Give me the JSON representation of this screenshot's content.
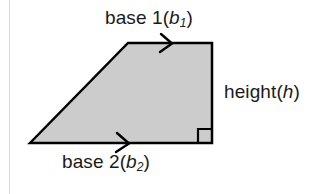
{
  "figure": {
    "shape": {
      "name": "trapezoid",
      "fill_color": "#cccccc",
      "stroke_color": "#000000",
      "stroke_width": 2.5,
      "vertices": [
        [
          30,
          143
        ],
        [
          128,
          43
        ],
        [
          212,
          43
        ],
        [
          212,
          143
        ]
      ]
    },
    "right_angle_marker": {
      "name": "right-angle-square",
      "x": 198,
      "y": 129,
      "size": 14,
      "stroke_color": "#000000"
    },
    "parallel_marks": [
      {
        "name": "top-edge-chevron",
        "edge": "base 1",
        "x": 168,
        "y": 43
      },
      {
        "name": "bottom-edge-chevron",
        "edge": "base 2",
        "x": 124,
        "y": 143
      }
    ],
    "labels": {
      "base1": {
        "text": "base 1",
        "paren_open": "(",
        "variable": "b",
        "subscript": "1",
        "paren_close": ")",
        "full": "base 1 (b1)"
      },
      "base2": {
        "text": "base 2",
        "paren_open": "(",
        "variable": "b",
        "subscript": "2",
        "paren_close": ")",
        "full": "base 2 (b2)"
      },
      "height": {
        "text": "height",
        "paren_open": "(",
        "variable": "h",
        "paren_close": ")",
        "full": "height (h)"
      }
    },
    "colors": {
      "background": "#ffffff",
      "text": "#1a1a1a",
      "shape_fill": "#cccccc",
      "shape_stroke": "#000000",
      "margin_rule": "#d8d8d8"
    }
  }
}
